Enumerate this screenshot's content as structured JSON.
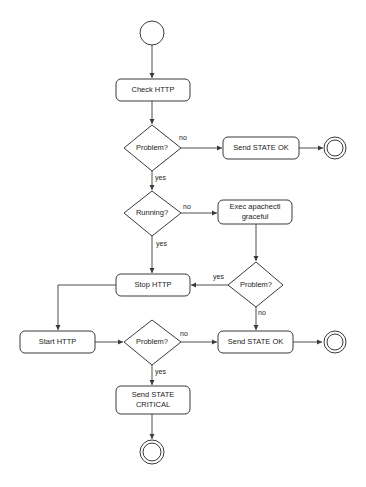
{
  "diagram": {
    "type": "activity-flowchart",
    "nodes": {
      "start": {
        "kind": "initial"
      },
      "check_http": {
        "kind": "action",
        "label": "Check HTTP"
      },
      "decision_problem_1": {
        "kind": "decision",
        "label": "Problem?"
      },
      "send_ok_1": {
        "kind": "action",
        "label": "Send STATE OK"
      },
      "end_1": {
        "kind": "final"
      },
      "decision_running": {
        "kind": "decision",
        "label": "Running?"
      },
      "exec_graceful": {
        "kind": "action",
        "label_line1": "Exec apachectl",
        "label_line2": "graceful"
      },
      "decision_problem_2": {
        "kind": "decision",
        "label": "Problem?"
      },
      "stop_http": {
        "kind": "action",
        "label": "Stop HTTP"
      },
      "start_http": {
        "kind": "action",
        "label": "Start HTTP"
      },
      "decision_problem_3": {
        "kind": "decision",
        "label": "Problem?"
      },
      "send_ok_2": {
        "kind": "action",
        "label": "Send STATE OK"
      },
      "end_2": {
        "kind": "final"
      },
      "send_critical": {
        "kind": "action",
        "label_line1": "Send STATE",
        "label_line2": "CRITICAL"
      },
      "end_3": {
        "kind": "final"
      }
    },
    "edges": [
      {
        "from": "start",
        "to": "check_http",
        "label": ""
      },
      {
        "from": "check_http",
        "to": "decision_problem_1",
        "label": ""
      },
      {
        "from": "decision_problem_1",
        "to": "send_ok_1",
        "label": "no"
      },
      {
        "from": "send_ok_1",
        "to": "end_1",
        "label": ""
      },
      {
        "from": "decision_problem_1",
        "to": "decision_running",
        "label": "yes"
      },
      {
        "from": "decision_running",
        "to": "exec_graceful",
        "label": "no"
      },
      {
        "from": "decision_running",
        "to": "stop_http",
        "label": "yes"
      },
      {
        "from": "exec_graceful",
        "to": "decision_problem_2",
        "label": ""
      },
      {
        "from": "decision_problem_2",
        "to": "stop_http",
        "label": "yes"
      },
      {
        "from": "decision_problem_2",
        "to": "send_ok_2",
        "label": "no"
      },
      {
        "from": "stop_http",
        "to": "start_http",
        "label": ""
      },
      {
        "from": "start_http",
        "to": "decision_problem_3",
        "label": ""
      },
      {
        "from": "decision_problem_3",
        "to": "send_ok_2",
        "label": "no"
      },
      {
        "from": "decision_problem_3",
        "to": "send_critical",
        "label": "yes"
      },
      {
        "from": "send_ok_2",
        "to": "end_2",
        "label": ""
      },
      {
        "from": "send_critical",
        "to": "end_3",
        "label": ""
      }
    ],
    "edge_labels": {
      "yes": "yes",
      "no": "no"
    }
  }
}
